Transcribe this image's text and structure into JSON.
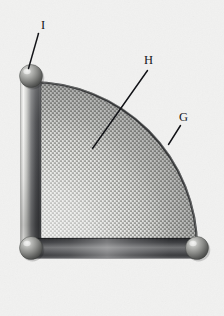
{
  "figure": {
    "kind": "technical-line-drawing",
    "background_color": "#f1f1f0",
    "labels": [
      {
        "id": "label-i",
        "text": "I",
        "x": 41,
        "y": 29,
        "target": "upper-left-sphere-joint",
        "leader": {
          "x1": 38.5,
          "y1": 33.5,
          "x2": 28.5,
          "y2": 68.5
        }
      },
      {
        "id": "label-h",
        "text": "H",
        "x": 144,
        "y": 64,
        "target": "woven-mesh-panel",
        "leader": {
          "x1": 147.5,
          "y1": 70.5,
          "x2": 92.5,
          "y2": 148.5
        }
      },
      {
        "id": "label-g",
        "text": "G",
        "x": 179,
        "y": 121,
        "target": "curved-arc-rim",
        "leader": {
          "x1": 180.5,
          "y1": 125.5,
          "x2": 168.5,
          "y2": 144.5
        }
      }
    ],
    "geometry": {
      "origin_x": 31,
      "origin_y": 248,
      "radius": 166,
      "arc_start_angle_deg": 0,
      "arc_end_angle_deg": 90
    },
    "parts": [
      {
        "name": "arc-rim",
        "label": "G",
        "color_dark": "#3a3b3d",
        "color_light": "#b9bab8"
      },
      {
        "name": "mesh-panel",
        "label": "H",
        "color_light": "#d4d5d2",
        "color_dark": "#8e8f8c"
      },
      {
        "name": "sphere-joint-upper-left",
        "label": "I",
        "cx": 31,
        "cy": 76,
        "r": 11.5
      },
      {
        "name": "sphere-joint-lower-left",
        "cx": 31,
        "cy": 248,
        "r": 11.5
      },
      {
        "name": "sphere-joint-lower-right",
        "cx": 197,
        "cy": 248,
        "r": 11.5
      },
      {
        "name": "vertical-frame-bar",
        "x": 21,
        "y": 76,
        "width": 20,
        "height": 172
      },
      {
        "name": "horizontal-frame-bar",
        "x": 31,
        "y": 238,
        "width": 166,
        "height": 20
      }
    ]
  }
}
